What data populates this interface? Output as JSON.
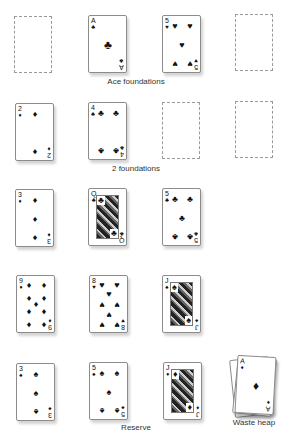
{
  "labels": {
    "ace_foundations": "Ace foundations",
    "two_foundations": "2 foundations",
    "reserve": "Reserve",
    "waste_heap": "Waste heap"
  },
  "suits": {
    "spades": "♠",
    "hearts": "♥",
    "diamonds": "♦",
    "clubs": "♣"
  },
  "ace_foundations": [
    {
      "empty": true
    },
    {
      "rank": "A",
      "suit": "clubs",
      "suit_glyph": "♣"
    },
    {
      "rank": "5",
      "suit": "hearts",
      "suit_glyph": "♥"
    },
    {
      "empty": true
    }
  ],
  "two_foundations": [
    {
      "rank": "2",
      "suit": "diamonds",
      "suit_glyph": "♦"
    },
    {
      "rank": "4",
      "suit": "clubs",
      "suit_glyph": "♣"
    },
    {
      "empty": true
    },
    {
      "empty": true
    }
  ],
  "reserve": [
    [
      {
        "rank": "3",
        "suit": "diamonds",
        "suit_glyph": "♦"
      },
      {
        "rank": "Q",
        "suit": "clubs",
        "suit_glyph": "♣"
      },
      {
        "rank": "5",
        "suit": "clubs",
        "suit_glyph": "♣"
      }
    ],
    [
      {
        "rank": "9",
        "suit": "diamonds",
        "suit_glyph": "♦"
      },
      {
        "rank": "8",
        "suit": "hearts",
        "suit_glyph": "♥"
      },
      {
        "rank": "J",
        "suit": "spades",
        "suit_glyph": "♠"
      }
    ],
    [
      {
        "rank": "3",
        "suit": "spades",
        "suit_glyph": "♠"
      },
      {
        "rank": "5",
        "suit": "spades",
        "suit_glyph": "♠"
      },
      {
        "rank": "J",
        "suit": "diamonds",
        "suit_glyph": "♦"
      }
    ]
  ],
  "waste_heap": {
    "top_card": {
      "rank": "A",
      "suit": "diamonds",
      "suit_glyph": "♦"
    }
  }
}
